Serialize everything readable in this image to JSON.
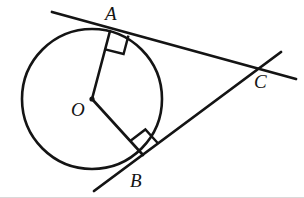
{
  "figure": {
    "width": 304,
    "height": 198,
    "background_color": "#ffffff",
    "stroke_color": "#141414",
    "labels": {
      "center": "O",
      "tangent_point_upper": "A",
      "tangent_point_lower": "B",
      "external_point": "C"
    },
    "label_positions": {
      "center": {
        "x": 71,
        "y": 100
      },
      "tangent_point_upper": {
        "x": 105,
        "y": 4
      },
      "tangent_point_lower": {
        "x": 130,
        "y": 171
      },
      "external_point": {
        "x": 254,
        "y": 72
      }
    }
  },
  "chart_data": {
    "type": "diagram",
    "elements": {
      "circle": {
        "name": "circle-o",
        "center": {
          "x": 92,
          "y": 99
        },
        "radius": 70,
        "stroke_width": 2.6
      },
      "center_dot": {
        "name": "center-point-o",
        "x": 92,
        "y": 99,
        "radius": 2.6
      },
      "points": [
        {
          "id": "O",
          "label": "O",
          "x": 92,
          "y": 99,
          "role": "circle-center"
        },
        {
          "id": "A",
          "label": "A",
          "x": 110,
          "y": 31,
          "role": "tangent-point"
        },
        {
          "id": "B",
          "label": "B",
          "x": 143,
          "y": 155,
          "role": "tangent-point"
        },
        {
          "id": "C",
          "label": "C",
          "x": 258,
          "y": 68,
          "role": "external-intersection"
        }
      ],
      "segments": [
        {
          "id": "OA",
          "name": "radius-o-a",
          "from": {
            "x": 92,
            "y": 99
          },
          "to": {
            "x": 110,
            "y": 31
          },
          "stroke_width": 2.6
        },
        {
          "id": "OB",
          "name": "radius-o-b",
          "from": {
            "x": 92,
            "y": 99
          },
          "to": {
            "x": 143,
            "y": 155
          },
          "stroke_width": 2.6
        }
      ],
      "tangent_lines": [
        {
          "id": "tangent-through-A",
          "name": "tangent-line-a-c",
          "from": {
            "x": 52,
            "y": 12
          },
          "to": {
            "x": 296,
            "y": 79
          },
          "stroke_width": 2.8,
          "touches": "A",
          "passes_through": "C"
        },
        {
          "id": "tangent-through-B",
          "name": "tangent-line-b-c",
          "from": {
            "x": 94,
            "y": 191
          },
          "to": {
            "x": 281,
            "y": 52
          },
          "stroke_width": 2.8,
          "touches": "B",
          "passes_through": "C"
        }
      ],
      "right_angle_marks": [
        {
          "id": "right-angle-at-A",
          "name": "right-angle-marker-a",
          "vertex": {
            "x": 110,
            "y": 31
          },
          "size": 19,
          "stroke_width": 2.4,
          "measure_degrees": 90
        },
        {
          "id": "right-angle-at-B",
          "name": "right-angle-marker-b",
          "vertex": {
            "x": 143,
            "y": 155
          },
          "size": 19,
          "stroke_width": 2.4,
          "measure_degrees": 90
        }
      ]
    },
    "annotations": [
      "OA ⊥ tangent at A",
      "OB ⊥ tangent at B",
      "Tangents from A and B meet at external point C"
    ]
  }
}
